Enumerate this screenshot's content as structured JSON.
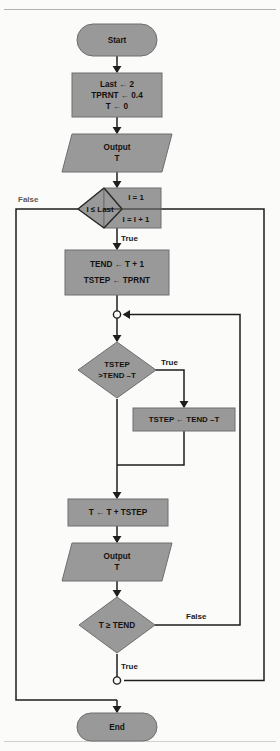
{
  "diagram": {
    "kind": "flowchart",
    "title_rule_visible": true,
    "colors": {
      "shape_fill": "#999999",
      "shape_stroke": "#6e6e6e",
      "line": "#1e1e1c",
      "page_bg": "#fbfbfa",
      "rule": "#b4b2ae"
    },
    "nodes": {
      "start": {
        "label": "Start",
        "shape": "terminator"
      },
      "init": {
        "shape": "process",
        "lines": [
          "Last ← 2",
          "TPRNT ← 0.4",
          "T ← 0"
        ]
      },
      "output_t_1": {
        "shape": "parallelogram",
        "lines": [
          "Output",
          "T"
        ]
      },
      "loop": {
        "shape": "loop-for",
        "condition": "I ≤ Last",
        "init": "I = 1",
        "increment": "I = I + 1"
      },
      "tend_assign": {
        "shape": "process",
        "lines": [
          "TEND ← T + 1",
          "TSTEP ← TPRNT"
        ]
      },
      "junction_top": {
        "shape": "connector-circle"
      },
      "tstep_test": {
        "shape": "decision",
        "lines": [
          "TSTEP",
          ">TEND –T"
        ]
      },
      "tstep_clamp": {
        "shape": "process",
        "lines": [
          "TSTEP ← TEND –T"
        ]
      },
      "t_advance": {
        "shape": "process",
        "lines": [
          "T ← T + TSTEP"
        ]
      },
      "output_t_2": {
        "shape": "parallelogram",
        "lines": [
          "Output",
          "T"
        ]
      },
      "t_test": {
        "shape": "decision",
        "lines": [
          "T ≥ TEND"
        ]
      },
      "junction_bottom": {
        "shape": "connector-circle"
      },
      "end": {
        "label": "End",
        "shape": "terminator"
      }
    },
    "edge_labels": {
      "loop_false": "False",
      "loop_true": "True",
      "tstep_true": "True",
      "t_test_false": "False",
      "t_test_true": "True"
    }
  }
}
